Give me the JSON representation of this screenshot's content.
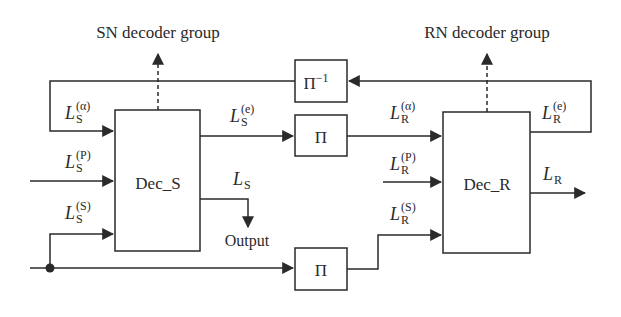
{
  "diagram": {
    "type": "block-diagram",
    "groups": {
      "sn": {
        "label": "SN decoder group"
      },
      "rn": {
        "label": "RN decoder group"
      }
    },
    "blocks": {
      "dec_s": {
        "label": "Dec_S"
      },
      "dec_r": {
        "label": "Dec_R"
      },
      "interleaver_top": {
        "label": "Π"
      },
      "deinterleaver": {
        "label": "Π",
        "superscript": "−1"
      },
      "interleaver_bottom": {
        "label": "Π"
      }
    },
    "signals": {
      "ls_a": {
        "base": "L",
        "sub": "S",
        "sup": "(α)"
      },
      "ls_p": {
        "base": "L",
        "sub": "S",
        "sup": "(P)"
      },
      "ls_s": {
        "base": "L",
        "sub": "S",
        "sup": "(S)"
      },
      "ls_e": {
        "base": "L",
        "sub": "S",
        "sup": "(e)"
      },
      "ls": {
        "base": "L",
        "sub": "S"
      },
      "lr_a": {
        "base": "L",
        "sub": "R",
        "sup": "(α)"
      },
      "lr_p": {
        "base": "L",
        "sub": "R",
        "sup": "(P)"
      },
      "lr_s": {
        "base": "L",
        "sub": "R",
        "sup": "(S)"
      },
      "lr_e": {
        "base": "L",
        "sub": "R",
        "sup": "(e)"
      },
      "lr": {
        "base": "L",
        "sub": "R"
      }
    },
    "output_label": "Output",
    "colors": {
      "stroke": "#2a2a2a",
      "background": "#ffffff"
    }
  }
}
